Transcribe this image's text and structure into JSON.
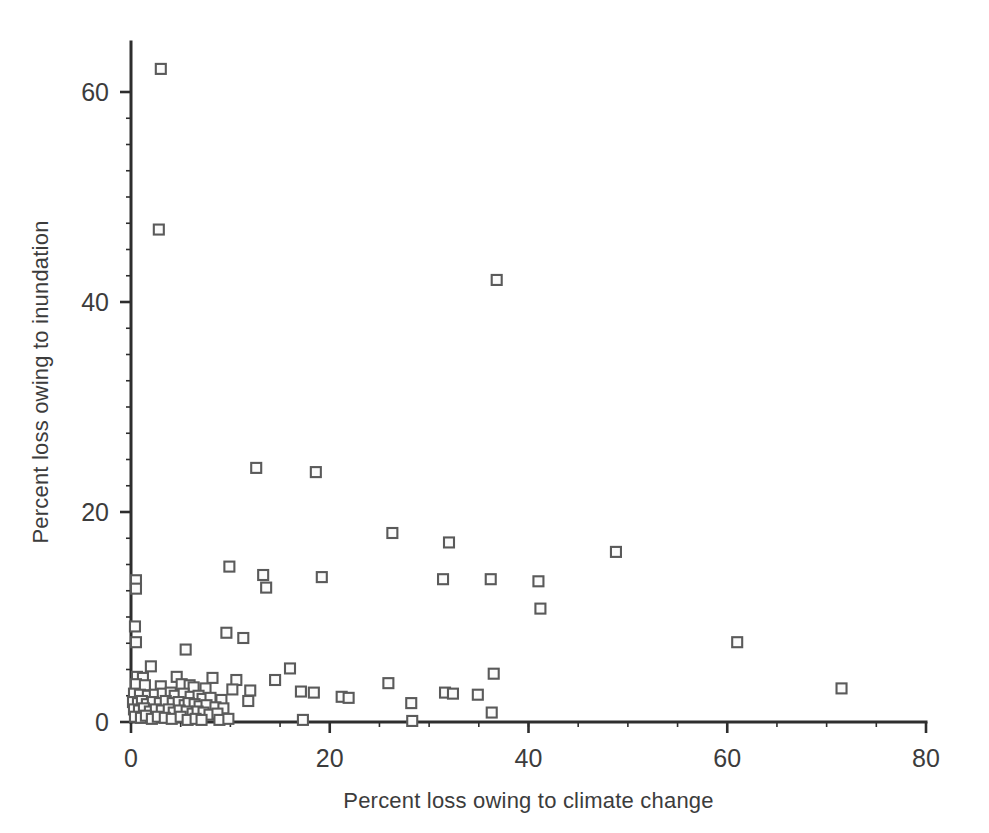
{
  "chart_data": {
    "type": "scatter",
    "title": "",
    "xlabel": "Percent loss owing to climate change",
    "ylabel": "Percent loss owing to inundation",
    "xlim": [
      0,
      80
    ],
    "ylim": [
      0,
      64
    ],
    "xticks": [
      0,
      20,
      40,
      60,
      80
    ],
    "xtick_labels": [
      "0",
      "20",
      "40",
      "60",
      "80"
    ],
    "yticks": [
      0,
      20,
      40,
      60
    ],
    "ytick_labels": [
      "0",
      "20",
      "40",
      "60"
    ],
    "x_minor_tick_step": 5,
    "y_minor_tick_step": 2.5,
    "grid": false,
    "legend": null,
    "marker": {
      "shape": "square",
      "fill": "#fbfbfb",
      "stroke": "#5a5a5a",
      "size_px": 10
    },
    "axis_color": "#2e2e2e",
    "background": "#ffffff",
    "n_points": 110,
    "points": [
      [
        3.0,
        62.2
      ],
      [
        2.8,
        46.9
      ],
      [
        36.8,
        42.1
      ],
      [
        12.6,
        24.2
      ],
      [
        18.6,
        23.8
      ],
      [
        26.3,
        18.0
      ],
      [
        32.0,
        17.1
      ],
      [
        48.8,
        16.2
      ],
      [
        9.9,
        14.8
      ],
      [
        13.3,
        14.0
      ],
      [
        19.2,
        13.8
      ],
      [
        31.4,
        13.6
      ],
      [
        36.2,
        13.6
      ],
      [
        41.0,
        13.4
      ],
      [
        13.6,
        12.8
      ],
      [
        0.5,
        13.5
      ],
      [
        0.5,
        12.7
      ],
      [
        41.2,
        10.8
      ],
      [
        0.4,
        9.1
      ],
      [
        9.6,
        8.5
      ],
      [
        11.3,
        8.0
      ],
      [
        0.5,
        7.6
      ],
      [
        61.0,
        7.6
      ],
      [
        5.5,
        6.9
      ],
      [
        2.0,
        5.3
      ],
      [
        16.0,
        5.1
      ],
      [
        36.5,
        4.6
      ],
      [
        0.6,
        4.3
      ],
      [
        1.2,
        4.2
      ],
      [
        4.6,
        4.3
      ],
      [
        8.2,
        4.2
      ],
      [
        10.6,
        4.0
      ],
      [
        14.5,
        4.0
      ],
      [
        25.9,
        3.7
      ],
      [
        71.5,
        3.2
      ],
      [
        0.5,
        3.6
      ],
      [
        1.4,
        3.5
      ],
      [
        3.0,
        3.4
      ],
      [
        5.1,
        3.6
      ],
      [
        5.9,
        3.5
      ],
      [
        6.3,
        3.3
      ],
      [
        7.5,
        3.2
      ],
      [
        10.2,
        3.1
      ],
      [
        12.0,
        3.0
      ],
      [
        17.1,
        2.9
      ],
      [
        18.4,
        2.8
      ],
      [
        21.2,
        2.4
      ],
      [
        21.9,
        2.3
      ],
      [
        31.6,
        2.8
      ],
      [
        32.4,
        2.7
      ],
      [
        34.9,
        2.6
      ],
      [
        0.3,
        2.7
      ],
      [
        0.9,
        2.6
      ],
      [
        1.7,
        2.5
      ],
      [
        2.4,
        2.6
      ],
      [
        3.2,
        2.7
      ],
      [
        4.0,
        2.8
      ],
      [
        4.4,
        2.5
      ],
      [
        5.3,
        2.7
      ],
      [
        6.0,
        2.4
      ],
      [
        6.8,
        2.5
      ],
      [
        7.2,
        2.2
      ],
      [
        8.0,
        2.3
      ],
      [
        9.1,
        2.1
      ],
      [
        11.8,
        2.0
      ],
      [
        28.2,
        1.8
      ],
      [
        36.3,
        0.9
      ],
      [
        0.2,
        1.9
      ],
      [
        0.7,
        1.8
      ],
      [
        1.1,
        2.0
      ],
      [
        1.6,
        1.7
      ],
      [
        2.2,
        1.9
      ],
      [
        2.9,
        1.8
      ],
      [
        3.5,
        2.0
      ],
      [
        4.2,
        1.8
      ],
      [
        4.8,
        1.9
      ],
      [
        5.4,
        1.6
      ],
      [
        5.8,
        1.8
      ],
      [
        6.4,
        1.7
      ],
      [
        6.9,
        1.5
      ],
      [
        7.6,
        1.6
      ],
      [
        8.5,
        1.4
      ],
      [
        9.3,
        1.3
      ],
      [
        0.3,
        1.2
      ],
      [
        0.8,
        1.1
      ],
      [
        1.3,
        1.3
      ],
      [
        1.9,
        1.0
      ],
      [
        2.5,
        1.2
      ],
      [
        3.1,
        1.1
      ],
      [
        3.8,
        1.2
      ],
      [
        4.3,
        0.9
      ],
      [
        4.9,
        1.1
      ],
      [
        5.6,
        1.0
      ],
      [
        6.2,
        0.8
      ],
      [
        6.7,
        1.0
      ],
      [
        7.3,
        0.9
      ],
      [
        7.9,
        0.7
      ],
      [
        8.7,
        0.8
      ],
      [
        0.4,
        0.5
      ],
      [
        1.0,
        0.4
      ],
      [
        1.5,
        0.6
      ],
      [
        2.1,
        0.3
      ],
      [
        2.7,
        0.5
      ],
      [
        3.4,
        0.4
      ],
      [
        4.1,
        0.3
      ],
      [
        5.0,
        0.5
      ],
      [
        5.7,
        0.2
      ],
      [
        6.5,
        0.3
      ],
      [
        7.1,
        0.2
      ],
      [
        8.9,
        0.2
      ],
      [
        9.8,
        0.3
      ],
      [
        17.3,
        0.2
      ],
      [
        28.3,
        0.1
      ]
    ]
  },
  "geometry": {
    "origin_x_px": 131,
    "origin_y_px": 722,
    "x_end_px": 926,
    "y_top_px": 42
  }
}
